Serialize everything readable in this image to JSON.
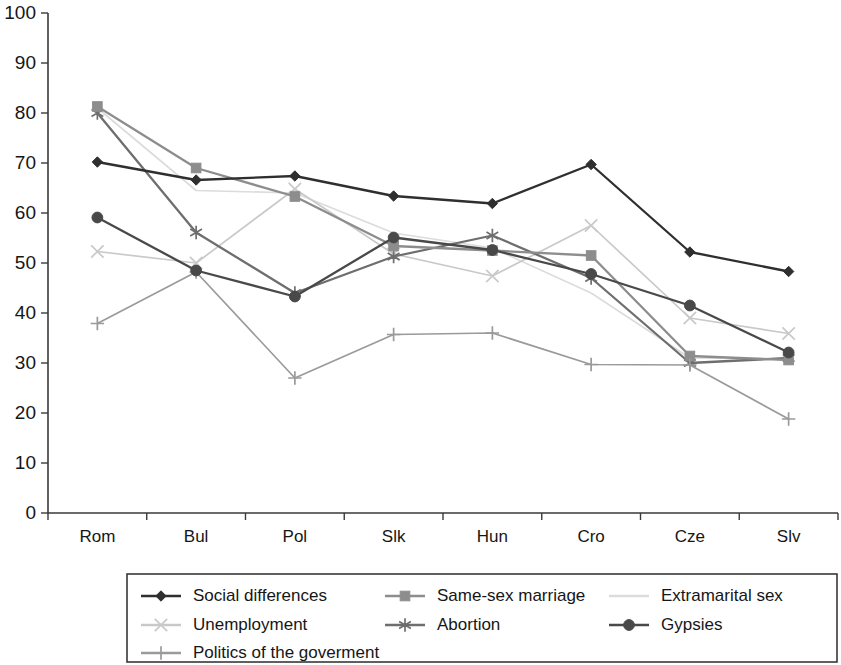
{
  "chart_data": {
    "type": "line",
    "title": "",
    "subtitle": "",
    "xlabel": "",
    "ylabel": "",
    "ylim": [
      0,
      100
    ],
    "yticks": [
      0,
      10,
      20,
      30,
      40,
      50,
      60,
      70,
      80,
      90,
      100
    ],
    "grid": false,
    "legend_position": "bottom",
    "categories": [
      "Rom",
      "Bul",
      "Pol",
      "Slk",
      "Hun",
      "Cro",
      "Cze",
      "Slv"
    ],
    "series": [
      {
        "name": "Social differences",
        "marker": "diamond",
        "color": "#2f2f2f",
        "values": [
          70.2,
          66.6,
          67.4,
          63.4,
          61.9,
          69.7,
          52.2,
          48.3
        ]
      },
      {
        "name": "Same-sex marriage",
        "marker": "square",
        "color": "#8d8d8d",
        "values": [
          81.3,
          69.0,
          63.3,
          53.4,
          52.5,
          51.5,
          31.4,
          30.6
        ]
      },
      {
        "name": "Extramarital sex",
        "marker": "none",
        "color": "#dcdcdc",
        "values": [
          81.0,
          64.5,
          64.0,
          56.0,
          53.0,
          44.0,
          31.0,
          30.8
        ]
      },
      {
        "name": "Unemployment",
        "marker": "x",
        "color": "#c9c9c9",
        "values": [
          52.3,
          50.0,
          64.8,
          51.8,
          47.4,
          57.5,
          39.0,
          35.9
        ]
      },
      {
        "name": "Abortion",
        "marker": "asterisk",
        "color": "#6e6e6e",
        "values": [
          80.0,
          56.1,
          44.0,
          51.3,
          55.5,
          47.0,
          30.0,
          31.0
        ]
      },
      {
        "name": "Gypsies",
        "marker": "circle",
        "color": "#494949",
        "values": [
          59.1,
          48.5,
          43.3,
          55.1,
          52.6,
          47.8,
          41.5,
          32.1
        ]
      },
      {
        "name": "Politics of the goverment",
        "marker": "plus",
        "color": "#9a9a9a",
        "values": [
          37.9,
          48.2,
          27.0,
          35.7,
          36.0,
          29.7,
          29.6,
          18.8
        ]
      }
    ]
  },
  "legend": {
    "entries": [
      {
        "label": "Social differences"
      },
      {
        "label": "Same-sex marriage"
      },
      {
        "label": "Extramarital sex"
      },
      {
        "label": "Unemployment"
      },
      {
        "label": "Abortion"
      },
      {
        "label": "Gypsies"
      },
      {
        "label": "Politics of the goverment"
      }
    ]
  },
  "axes": {
    "y_tick_labels": [
      "100",
      "90",
      "80",
      "70",
      "60",
      "50",
      "40",
      "30",
      "20",
      "10",
      "0"
    ],
    "x_tick_labels": [
      "Rom",
      "Bul",
      "Pol",
      "Slk",
      "Hun",
      "Cro",
      "Cze",
      "Slv"
    ]
  }
}
